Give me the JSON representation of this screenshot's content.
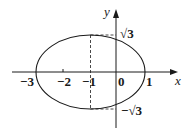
{
  "diagram": {
    "type": "ellipse-on-coordinate-axes",
    "axes": {
      "x_label": "x",
      "y_label": "y",
      "origin_label": "0"
    },
    "x_ticks": [
      {
        "value": -3,
        "label": "−3"
      },
      {
        "value": -2,
        "label": "−2"
      },
      {
        "value": -1,
        "label": "−1"
      },
      {
        "value": 1,
        "label": "1"
      }
    ],
    "y_ticks": [
      {
        "value": "sqrt3",
        "label": "√3"
      },
      {
        "value": "-sqrt3",
        "label": "−√3"
      }
    ],
    "ellipse": {
      "center_x": -1,
      "center_y": 0,
      "semi_axis_x": 2,
      "semi_axis_y": "√3",
      "left_vertex": -3,
      "right_vertex": 1
    },
    "dashed_guides": [
      "vertical line x = −1 from y = √3 to y = −√3",
      "horizontal line y = √3 from x = −1 to y-axis",
      "horizontal line y = −√3 from x = −1 to y-axis"
    ],
    "colors": {
      "stroke": "#1a1a1a",
      "background": "#ffffff"
    }
  }
}
